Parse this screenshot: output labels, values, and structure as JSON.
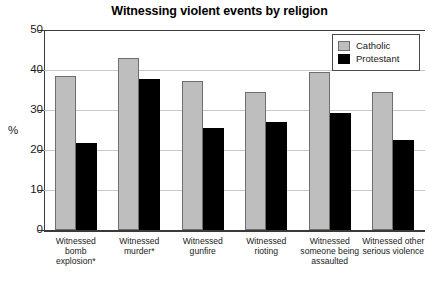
{
  "chart_data": {
    "type": "bar",
    "title": "Witnessing violent events by religion",
    "xlabel": "",
    "ylabel": "%",
    "ylim": [
      0,
      50
    ],
    "yticks": [
      0,
      10,
      20,
      30,
      40,
      50
    ],
    "ytick_labels": [
      "0",
      "10",
      "20",
      "30",
      "40",
      "50"
    ],
    "grid": true,
    "legend_position": "top-right",
    "categories": [
      "Witnessed bomb explosion*",
      "Witnessed murder*",
      "Witnessed gunfire",
      "Witnessed rioting",
      "Witnessed someone being assaulted",
      "Witnessed other serious violence"
    ],
    "series": [
      {
        "name": "Catholic",
        "color": "#bebebe",
        "values": [
          38.5,
          43.0,
          37.3,
          34.5,
          39.6,
          34.5
        ]
      },
      {
        "name": "Protestant",
        "color": "#000000",
        "values": [
          21.8,
          37.8,
          25.5,
          27.0,
          29.3,
          22.5
        ]
      }
    ]
  },
  "legend": {
    "items": [
      {
        "label": "Catholic"
      },
      {
        "label": "Protestant"
      }
    ]
  }
}
